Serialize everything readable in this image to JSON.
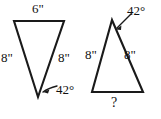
{
  "diagram": {
    "type": "geometry-triangle-pair",
    "stroke_color": "#1a1a1a",
    "text_color": "#111111",
    "background_color": "#ffffff",
    "left_triangle": {
      "name": "inverted-triangle",
      "orientation": "pointing-down",
      "vertices": [
        [
          14,
          21
        ],
        [
          64,
          21
        ],
        [
          38,
          97
        ]
      ],
      "top_side_label": "6\"",
      "left_side_label": "8\"",
      "right_side_label": "8\"",
      "apex_angle_label": "42°"
    },
    "right_triangle": {
      "name": "upright-triangle",
      "orientation": "pointing-up",
      "vertices": [
        [
          112,
          20
        ],
        [
          143,
          92
        ],
        [
          92,
          92
        ]
      ],
      "apex_angle_label": "42°",
      "left_side_label": "8\"",
      "right_side_label": "8\"",
      "base_label": "?"
    }
  }
}
